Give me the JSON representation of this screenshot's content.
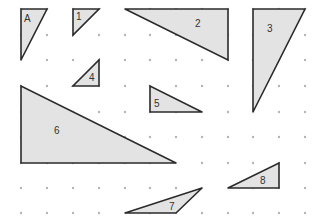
{
  "grid": {
    "columns_x": [
      21,
      47,
      73,
      99,
      125,
      150,
      176,
      202,
      228,
      253,
      279,
      305
    ],
    "rows_y": [
      9,
      35,
      60,
      86,
      112,
      137,
      163,
      188,
      213
    ],
    "dot_color": "#b5b5b5"
  },
  "style": {
    "fill": "#e3e3e3",
    "stroke": "#2b2b2b"
  },
  "triangles": [
    {
      "label": "A",
      "points": [
        [
          21,
          9
        ],
        [
          47,
          9
        ],
        [
          21,
          60
        ]
      ],
      "label_pos": [
        24,
        22
      ]
    },
    {
      "label": "1",
      "points": [
        [
          73,
          9
        ],
        [
          99,
          9
        ],
        [
          73,
          35
        ]
      ],
      "label_pos": [
        76,
        20
      ]
    },
    {
      "label": "2",
      "points": [
        [
          125,
          9
        ],
        [
          228,
          9
        ],
        [
          228,
          60
        ]
      ],
      "label_pos": [
        195,
        27
      ]
    },
    {
      "label": "3",
      "points": [
        [
          253,
          9
        ],
        [
          305,
          9
        ],
        [
          253,
          112
        ]
      ],
      "label_pos": [
        267,
        32
      ]
    },
    {
      "label": "4",
      "points": [
        [
          99,
          60
        ],
        [
          99,
          86
        ],
        [
          73,
          86
        ]
      ],
      "label_pos": [
        89,
        81
      ]
    },
    {
      "label": "5",
      "points": [
        [
          150,
          86
        ],
        [
          150,
          112
        ],
        [
          202,
          112
        ]
      ],
      "label_pos": [
        154,
        107
      ]
    },
    {
      "label": "6",
      "points": [
        [
          21,
          86
        ],
        [
          21,
          163
        ],
        [
          176,
          163
        ]
      ],
      "label_pos": [
        54,
        134
      ]
    },
    {
      "label": "7",
      "points": [
        [
          125,
          213
        ],
        [
          202,
          188
        ],
        [
          176,
          213
        ]
      ],
      "label_pos": [
        169,
        210
      ]
    },
    {
      "label": "8",
      "points": [
        [
          228,
          188
        ],
        [
          279,
          163
        ],
        [
          279,
          188
        ]
      ],
      "label_pos": [
        260,
        184
      ]
    }
  ]
}
